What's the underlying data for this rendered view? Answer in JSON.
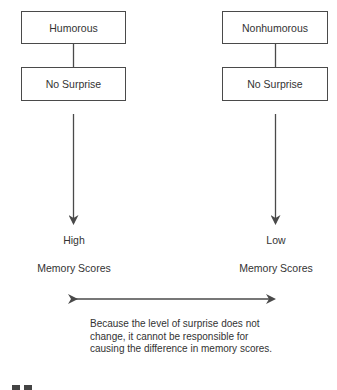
{
  "left_column": {
    "condition_label": "Humorous",
    "surprise_label": "No Surprise",
    "outcome_level": "High",
    "outcome_label": "Memory Scores"
  },
  "right_column": {
    "condition_label": "Nonhumorous",
    "surprise_label": "No Surprise",
    "outcome_level": "Low",
    "outcome_label": "Memory Scores"
  },
  "caption": "Because the level of surprise does not change, it cannot be responsible for causing the difference in memory scores.",
  "colors": {
    "line": "#4a4a4a",
    "text": "#333333",
    "background": "#ffffff"
  }
}
